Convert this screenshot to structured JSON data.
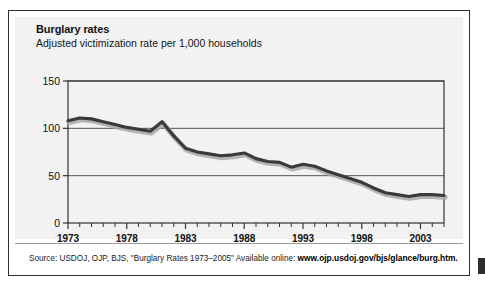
{
  "figure": {
    "title": "Burglary rates",
    "subtitle": "Adjusted victimization rate per 1,000 households",
    "source_prefix": "Source: USDOJ, OJP, BJS, \"Burglary Rates 1973–2005\" Available online: ",
    "source_url": "www.ojp.usdoj.gov/bjs/glance/burg.htm.",
    "panel_background": "#f2f2f2",
    "frame_color": "#2e2e2e",
    "line_color": "#3a3a3a",
    "shadow_color": "#a8a8a8",
    "gridline_color": "#555555"
  },
  "chart_data": {
    "type": "line",
    "title": "Burglary rates",
    "subtitle": "Adjusted victimization rate per 1,000 households",
    "xlabel": "",
    "ylabel": "",
    "ylim": [
      0,
      150
    ],
    "xlim": [
      1973,
      2005
    ],
    "yticks": [
      0,
      50,
      100,
      150
    ],
    "ytick_labels": [
      "0",
      "50",
      "100",
      "150"
    ],
    "xticks": [
      1973,
      1978,
      1983,
      1988,
      1993,
      1998,
      2003
    ],
    "xtick_labels": [
      "1973",
      "1978",
      "1983",
      "1988",
      "1993",
      "1998",
      "2003"
    ],
    "xtick_minor_step": 1,
    "grid": true,
    "grid_axis": "y",
    "legend": false,
    "series": [
      {
        "name": "Adjusted burglary victimization rate per 1,000 households",
        "x": [
          1973,
          1974,
          1975,
          1976,
          1977,
          1978,
          1979,
          1980,
          1981,
          1982,
          1983,
          1984,
          1985,
          1986,
          1987,
          1988,
          1989,
          1990,
          1991,
          1992,
          1993,
          1994,
          1995,
          1996,
          1997,
          1998,
          1999,
          2000,
          2001,
          2002,
          2003,
          2004,
          2005
        ],
        "values": [
          108,
          111,
          110,
          107,
          104,
          101,
          99,
          97,
          107,
          92,
          79,
          75,
          73,
          71,
          72,
          74,
          68,
          65,
          64,
          59,
          62,
          60,
          55,
          51,
          47,
          43,
          37,
          32,
          30,
          28,
          30,
          30,
          29
        ]
      }
    ]
  }
}
